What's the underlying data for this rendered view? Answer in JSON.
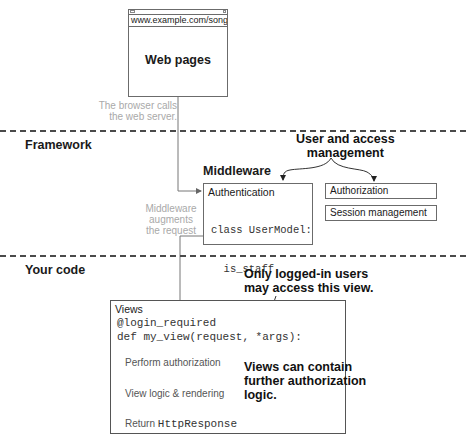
{
  "browser": {
    "url": "www.example.com/songs/",
    "title": "Web pages"
  },
  "notes": {
    "browser_calls": [
      "The browser calls",
      "the web server."
    ],
    "middleware_augments": [
      "Middleware",
      "augments",
      "the request"
    ]
  },
  "sections": {
    "framework": "Framework",
    "your_code": "Your code"
  },
  "middleware": {
    "title": "Middleware",
    "auth_label": "Authentication",
    "code_lines": [
      "class UserModel:",
      "  is_staff",
      "  is_admin"
    ]
  },
  "user_access": {
    "callout": [
      "User and access",
      "management"
    ],
    "boxes": [
      "Authorization",
      "Session management"
    ]
  },
  "views": {
    "label": "Views",
    "decorator": "@login_required",
    "def_line": "def my_view(request, *args):",
    "steps": [
      "Perform authorization",
      "View logic & rendering"
    ],
    "return_prefix": "Return ",
    "return_code": "HttpResponse"
  },
  "callouts": {
    "logged_in": [
      "Only logged-in users",
      "may access this view."
    ],
    "further_auth": [
      "Views can contain",
      "further authorization",
      "logic."
    ]
  }
}
